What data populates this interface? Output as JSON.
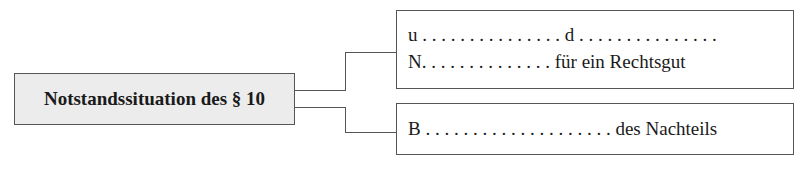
{
  "diagram": {
    "root": {
      "label": "Notstandssituation des § 10"
    },
    "branches": [
      {
        "lines": [
          "u . . . . . . . . . . . . . . . d . . . . . . . . . . . . . . .",
          "N. . . . . . . . . . . . . . für ein Rechtsgut"
        ]
      },
      {
        "lines": [
          "B . . . . . . . . . . . . . . . . . . . . des Nachteils"
        ]
      }
    ]
  },
  "colors": {
    "root_fill": "#ececec",
    "border": "#555555"
  }
}
